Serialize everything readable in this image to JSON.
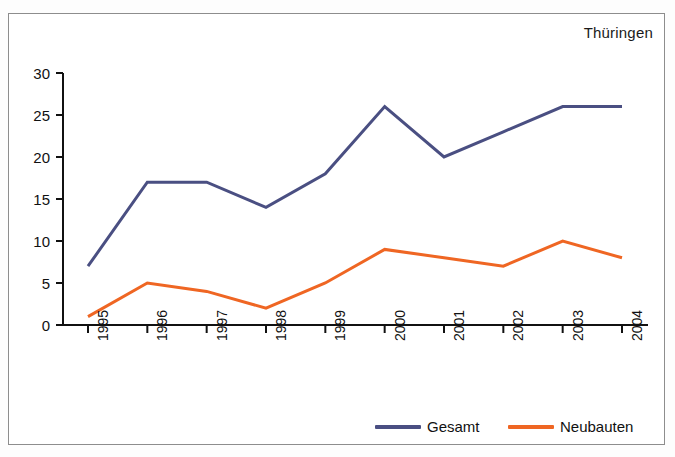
{
  "chart_data": {
    "type": "line",
    "title": "Thüringen",
    "xlabel": "",
    "ylabel": "",
    "categories": [
      "1995",
      "1996",
      "1997",
      "1998",
      "1999",
      "2000",
      "2001",
      "2002",
      "2003",
      "2004"
    ],
    "series": [
      {
        "name": "Gesamt",
        "color": "#4a4f82",
        "values": [
          7,
          17,
          17,
          14,
          18,
          26,
          20,
          23,
          26,
          26
        ]
      },
      {
        "name": "Neubauten",
        "color": "#ef6623",
        "values": [
          1,
          5,
          4,
          2,
          5,
          9,
          8,
          7,
          10,
          8
        ]
      }
    ],
    "ylim": [
      0,
      30
    ],
    "yticks": [
      0,
      5,
      10,
      15,
      20,
      25,
      30
    ],
    "ytick_labels": [
      "0",
      "5",
      "10",
      "15",
      "20",
      "25",
      "30"
    ],
    "grid": false,
    "legend_position": "bottom-right",
    "xtick_rotation": -90
  },
  "frame": {
    "border_color": "#8d8d8d",
    "background": "#ffffff"
  }
}
